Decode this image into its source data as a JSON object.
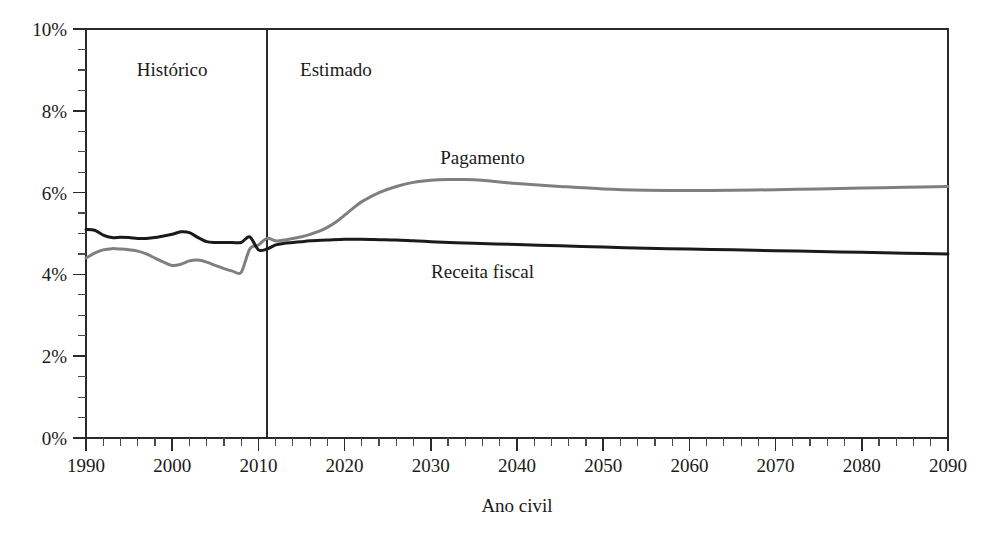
{
  "chart_data": {
    "type": "line",
    "title": "",
    "xlabel": "Ano civil",
    "ylabel": "",
    "xlim": [
      1990,
      2090
    ],
    "ylim": [
      0,
      10
    ],
    "grid": false,
    "legend_position": "inline-annotations",
    "x_tick_labels": [
      "1990",
      "2000",
      "2010",
      "2020",
      "2030",
      "2040",
      "2050",
      "2060",
      "2070",
      "2080",
      "2090"
    ],
    "x_major_ticks": [
      1990,
      2000,
      2010,
      2020,
      2030,
      2040,
      2050,
      2060,
      2070,
      2080,
      2090
    ],
    "x_minor_step": 2,
    "y_tick_labels": [
      "0%",
      "2%",
      "4%",
      "6%",
      "8%",
      "10%"
    ],
    "y_major_ticks": [
      0,
      2,
      4,
      6,
      8,
      10
    ],
    "y_minor_step": 0.5,
    "y_unit": "%",
    "annotations": [
      {
        "text": "Histórico",
        "x": 2000,
        "y": 9.0
      },
      {
        "text": "Estimado",
        "x": 2019,
        "y": 9.0
      },
      {
        "text": "Pagamento",
        "x": 2036,
        "y": 6.85
      },
      {
        "text": "Receita fiscal",
        "x": 2036,
        "y": 4.05
      }
    ],
    "divider": {
      "x": 2011,
      "label": "historical-projection-divider"
    },
    "series": [
      {
        "name": "Pagamento",
        "color": "#7f7f7f",
        "width": 3.0,
        "x": [
          1990,
          1991,
          1992,
          1993,
          1994,
          1995,
          1996,
          1997,
          1998,
          1999,
          2000,
          2001,
          2002,
          2003,
          2004,
          2005,
          2006,
          2007,
          2008,
          2009,
          2010,
          2011,
          2012,
          2013,
          2014,
          2015,
          2016,
          2017,
          2018,
          2019,
          2020,
          2021,
          2022,
          2024,
          2026,
          2028,
          2030,
          2032,
          2034,
          2036,
          2038,
          2040,
          2045,
          2050,
          2055,
          2060,
          2065,
          2070,
          2075,
          2080,
          2085,
          2090
        ],
        "values": [
          4.4,
          4.52,
          4.6,
          4.63,
          4.62,
          4.6,
          4.57,
          4.5,
          4.4,
          4.3,
          4.22,
          4.25,
          4.33,
          4.35,
          4.3,
          4.22,
          4.14,
          4.08,
          4.05,
          4.62,
          4.72,
          4.88,
          4.82,
          4.84,
          4.88,
          4.92,
          4.98,
          5.05,
          5.15,
          5.28,
          5.45,
          5.62,
          5.78,
          6.0,
          6.15,
          6.25,
          6.3,
          6.32,
          6.32,
          6.3,
          6.26,
          6.22,
          6.15,
          6.09,
          6.06,
          6.05,
          6.06,
          6.07,
          6.09,
          6.11,
          6.13,
          6.15
        ]
      },
      {
        "name": "Receita fiscal",
        "color": "#1a1a1a",
        "width": 3.0,
        "x": [
          1990,
          1991,
          1992,
          1993,
          1994,
          1995,
          1996,
          1997,
          1998,
          1999,
          2000,
          2001,
          2002,
          2003,
          2004,
          2005,
          2006,
          2007,
          2008,
          2009,
          2010,
          2011,
          2012,
          2013,
          2014,
          2015,
          2016,
          2018,
          2020,
          2022,
          2024,
          2026,
          2028,
          2030,
          2035,
          2040,
          2045,
          2050,
          2055,
          2060,
          2065,
          2070,
          2075,
          2080,
          2085,
          2090
        ],
        "values": [
          5.1,
          5.08,
          4.96,
          4.9,
          4.91,
          4.9,
          4.88,
          4.88,
          4.9,
          4.94,
          4.98,
          5.04,
          5.02,
          4.9,
          4.8,
          4.78,
          4.78,
          4.78,
          4.78,
          4.92,
          4.6,
          4.62,
          4.72,
          4.76,
          4.78,
          4.8,
          4.82,
          4.84,
          4.86,
          4.86,
          4.85,
          4.84,
          4.82,
          4.8,
          4.76,
          4.73,
          4.7,
          4.67,
          4.64,
          4.62,
          4.6,
          4.58,
          4.56,
          4.54,
          4.52,
          4.5
        ]
      }
    ]
  },
  "plot_geometry": {
    "left": 86,
    "right": 948,
    "top": 29,
    "bottom": 438
  }
}
